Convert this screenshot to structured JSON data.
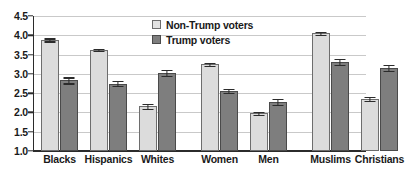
{
  "chart_data": {
    "type": "bar",
    "title": "",
    "subtitle": "",
    "xlabel": "",
    "ylabel": "",
    "ylim": [
      1.0,
      4.5
    ],
    "ytick_labels": [
      "4.5",
      "4.0",
      "3.5",
      "3.0",
      "2.5",
      "2.0",
      "1.5",
      "1.0"
    ],
    "ytick_values": [
      4.5,
      4.0,
      3.5,
      3.0,
      2.5,
      2.0,
      1.5,
      1.0
    ],
    "grid": true,
    "legend_position": "top-center",
    "categories": [
      "Blacks",
      "Hispanics",
      "Whites",
      "Women",
      "Men",
      "Muslims",
      "Christians"
    ],
    "groups": [
      {
        "name": "race",
        "categories": [
          "Blacks",
          "Hispanics",
          "Whites"
        ]
      },
      {
        "name": "gender",
        "categories": [
          "Women",
          "Men"
        ]
      },
      {
        "name": "religion",
        "categories": [
          "Muslims",
          "Christians"
        ]
      }
    ],
    "series": [
      {
        "name": "Non-Trump voters",
        "color": "#dcdcdc",
        "values": [
          3.88,
          3.62,
          2.16,
          3.25,
          1.98,
          4.05,
          2.35
        ],
        "errors": [
          0.04,
          0.03,
          0.06,
          0.04,
          0.04,
          0.04,
          0.06
        ]
      },
      {
        "name": "Trump voters",
        "color": "#7e7e7e",
        "values": [
          2.83,
          2.75,
          3.02,
          2.56,
          2.28,
          3.31,
          3.16
        ],
        "errors": [
          0.08,
          0.06,
          0.08,
          0.06,
          0.08,
          0.07,
          0.08
        ]
      }
    ]
  },
  "legend": {
    "entries": [
      {
        "label": "Non-Trump voters",
        "swatch": "light"
      },
      {
        "label": "Trump voters",
        "swatch": "dark"
      }
    ]
  }
}
